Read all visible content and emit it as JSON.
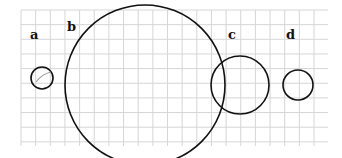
{
  "diagram": {
    "type": "circles-on-grid",
    "grid": {
      "x0": 21,
      "y0": 10,
      "x1": 328,
      "y1": 146,
      "cell": 14.65,
      "color": "#d6d6d6"
    },
    "stroke_color": "#111111",
    "circles": [
      {
        "label": "a",
        "cx": 42,
        "cy": 78,
        "r": 11,
        "label_x": 30,
        "label_y": 39,
        "hatch": true
      },
      {
        "label": "b",
        "cx": 145,
        "cy": 85,
        "r": 80,
        "label_x": 67,
        "label_y": 31,
        "hatch": false
      },
      {
        "label": "c",
        "cx": 240,
        "cy": 85,
        "r": 29,
        "label_x": 228,
        "label_y": 39,
        "hatch": false
      },
      {
        "label": "d",
        "cx": 298,
        "cy": 85,
        "r": 15,
        "label_x": 286,
        "label_y": 39,
        "hatch": false
      }
    ]
  }
}
